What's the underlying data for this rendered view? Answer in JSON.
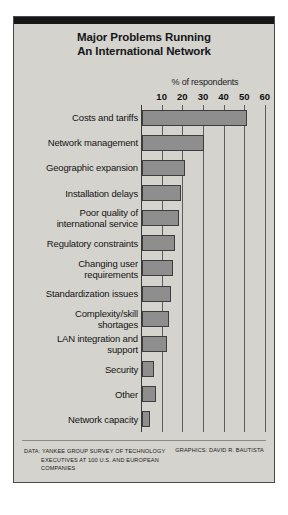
{
  "panel": {
    "title_line1": "Major Problems Running",
    "title_line2": "An International Network",
    "bg_color": "#d5d3ce",
    "header_color": "#161616"
  },
  "footer": {
    "data_credit_line1": "DATA: YANKEE GROUP SURVEY OF TECHNOLOGY",
    "data_credit_line2": "EXECUTIVES AT 100 U.S. AND EUROPEAN",
    "data_credit_line3": "COMPANIES",
    "graphics_credit": "GRAPHICS: DAVID R. BAUTISTA"
  },
  "chart_data": {
    "type": "bar",
    "orientation": "horizontal",
    "title": "Major Problems Running An International Network",
    "xlabel": "% of respondents",
    "ylabel": "",
    "xlim": [
      0,
      62
    ],
    "xticks": [
      10,
      20,
      30,
      40,
      50,
      60
    ],
    "grid": true,
    "legend": false,
    "bar_color": "#8e8e8e",
    "bar_edge_color": "#3d3d3d",
    "categories": [
      "Costs and tariffs",
      "Network management",
      "Geographic expansion",
      "Installation delays",
      "Poor quality of international service",
      "Regulatory constraints",
      "Changing user requirements",
      "Standardization issues",
      "Complexity/skill shortages",
      "LAN integration and support",
      "Security",
      "Other",
      "Network capacity"
    ],
    "category_lines": [
      [
        "Costs and tariffs"
      ],
      [
        "Network management"
      ],
      [
        "Geographic expansion"
      ],
      [
        "Installation delays"
      ],
      [
        "Poor quality of",
        "international service"
      ],
      [
        "Regulatory constraints"
      ],
      [
        "Changing user",
        "requirements"
      ],
      [
        "Standardization issues"
      ],
      [
        "Complexity/skill",
        "shortages"
      ],
      [
        "LAN integration and",
        "support"
      ],
      [
        "Security"
      ],
      [
        "Other"
      ],
      [
        "Network capacity"
      ]
    ],
    "values": [
      51,
      30,
      21,
      19,
      18,
      16,
      15,
      14,
      13,
      12,
      6,
      7,
      4
    ]
  }
}
